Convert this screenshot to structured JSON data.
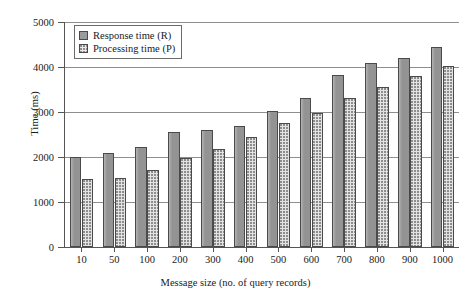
{
  "chart_data": {
    "type": "bar",
    "title": "",
    "xlabel": "Message size (no. of query records)",
    "ylabel": "Time (ms)",
    "categories": [
      "10",
      "50",
      "100",
      "200",
      "300",
      "400",
      "500",
      "600",
      "700",
      "800",
      "900",
      "1000"
    ],
    "series": [
      {
        "name": "Response time (R)",
        "color": "#9b9b9b",
        "values": [
          2000,
          2080,
          2220,
          2560,
          2600,
          2700,
          3020,
          3320,
          3820,
          4080,
          4200,
          4440
        ]
      },
      {
        "name": "Processing time (P)",
        "color": "#e3e3e3",
        "values": [
          1520,
          1540,
          1720,
          1980,
          2180,
          2440,
          2760,
          2980,
          3320,
          3560,
          3800,
          4020
        ]
      }
    ],
    "ylim": [
      0,
      5000
    ],
    "yticks": [
      0,
      1000,
      2000,
      3000,
      4000,
      5000
    ],
    "ytick_labels": [
      "0",
      "1000",
      "2000",
      "3000",
      "4000",
      "5000"
    ],
    "grid": "horizontal",
    "legend_position": "top-left"
  }
}
